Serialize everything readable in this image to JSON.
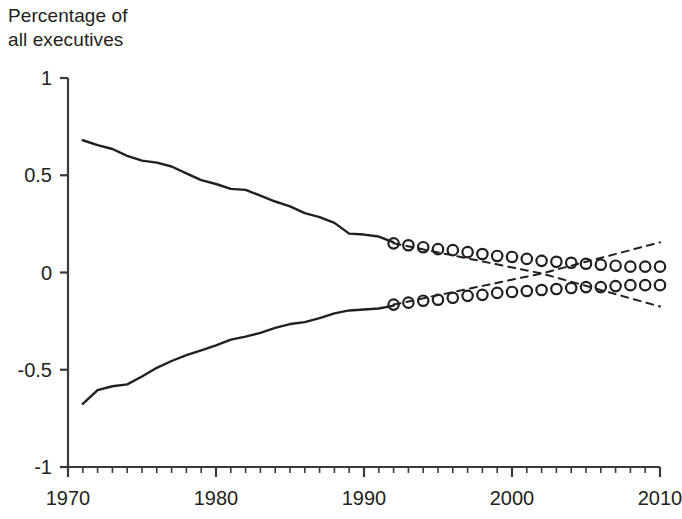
{
  "chart_data": {
    "type": "line",
    "title": "Percentage of\nall executives",
    "ylabel": "Percentage of all executives",
    "xlabel": "",
    "xlim": [
      1970,
      2010
    ],
    "ylim": [
      -1,
      1
    ],
    "grid": false,
    "legend": null,
    "x_ticks": [
      "1970",
      "1980",
      "1990",
      "2000",
      "2010"
    ],
    "x_tick_values": [
      1970,
      1980,
      1990,
      2000,
      2010
    ],
    "x_minor_tick_step": 1,
    "y_ticks": [
      "1",
      "0.5",
      "0",
      "-0.5",
      "-1"
    ],
    "y_tick_values": [
      1,
      0.5,
      0,
      -0.5,
      -1
    ],
    "line_color": "#231f20",
    "marker_color": "#231f20",
    "annotations": [
      "Solid lines show historical values 1971-1992",
      "Open circle markers show projected values 1992-2010",
      "Dashed lines show projection bounds that cross near 2002"
    ],
    "series": [
      {
        "name": "Upper series (historical)",
        "style": "solid-line",
        "x": [
          1971,
          1972,
          1973,
          1974,
          1975,
          1976,
          1977,
          1978,
          1979,
          1980,
          1981,
          1982,
          1983,
          1984,
          1985,
          1986,
          1987,
          1988,
          1989,
          1990,
          1991,
          1992
        ],
        "values": [
          0.68,
          0.655,
          0.635,
          0.6,
          0.575,
          0.565,
          0.545,
          0.51,
          0.475,
          0.455,
          0.43,
          0.425,
          0.395,
          0.365,
          0.34,
          0.305,
          0.285,
          0.255,
          0.2,
          0.195,
          0.185,
          0.155
        ]
      },
      {
        "name": "Lower series (historical)",
        "style": "solid-line",
        "x": [
          1971,
          1972,
          1973,
          1974,
          1975,
          1976,
          1977,
          1978,
          1979,
          1980,
          1981,
          1982,
          1983,
          1984,
          1985,
          1986,
          1987,
          1988,
          1989,
          1990,
          1991,
          1992
        ],
        "values": [
          -0.675,
          -0.605,
          -0.585,
          -0.575,
          -0.535,
          -0.49,
          -0.455,
          -0.425,
          -0.4,
          -0.375,
          -0.345,
          -0.33,
          -0.31,
          -0.285,
          -0.265,
          -0.255,
          -0.235,
          -0.21,
          -0.195,
          -0.19,
          -0.185,
          -0.17
        ]
      },
      {
        "name": "Upper series (projected)",
        "style": "open-circle-markers",
        "x": [
          1992,
          1993,
          1994,
          1995,
          1996,
          1997,
          1998,
          1999,
          2000,
          2001,
          2002,
          2003,
          2004,
          2005,
          2006,
          2007,
          2008,
          2009,
          2010
        ],
        "values": [
          0.15,
          0.14,
          0.13,
          0.12,
          0.115,
          0.105,
          0.095,
          0.085,
          0.08,
          0.07,
          0.06,
          0.055,
          0.05,
          0.045,
          0.04,
          0.035,
          0.03,
          0.03,
          0.03
        ]
      },
      {
        "name": "Lower series (projected)",
        "style": "open-circle-markers",
        "x": [
          1992,
          1993,
          1994,
          1995,
          1996,
          1997,
          1998,
          1999,
          2000,
          2001,
          2002,
          2003,
          2004,
          2005,
          2006,
          2007,
          2008,
          2009,
          2010
        ],
        "values": [
          -0.165,
          -0.155,
          -0.145,
          -0.14,
          -0.13,
          -0.12,
          -0.115,
          -0.105,
          -0.1,
          -0.095,
          -0.09,
          -0.085,
          -0.08,
          -0.075,
          -0.075,
          -0.07,
          -0.065,
          -0.065,
          -0.065
        ]
      },
      {
        "name": "Upper bound (dashed)",
        "style": "dashed-line",
        "x": [
          1992,
          2002,
          2010
        ],
        "values": [
          0.15,
          -0.005,
          0.155
        ]
      },
      {
        "name": "Lower bound (dashed)",
        "style": "dashed-line",
        "x": [
          1992,
          2002,
          2010
        ],
        "values": [
          -0.165,
          -0.005,
          -0.175
        ]
      }
    ]
  }
}
